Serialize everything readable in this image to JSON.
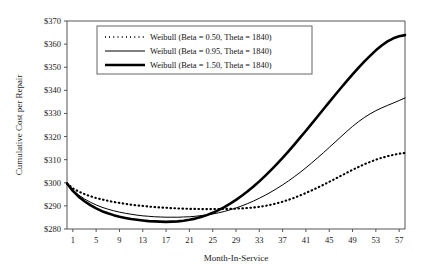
{
  "chart_data": {
    "type": "line",
    "title": "",
    "xlabel": "Month-In-Service",
    "ylabel": "Cumulative Cost per Repair",
    "xlim": [
      0,
      58
    ],
    "ylim": [
      280,
      370
    ],
    "ytick_labels": [
      "$280",
      "$290",
      "$300",
      "$310",
      "$320",
      "$330",
      "$340",
      "$350",
      "$360",
      "$370"
    ],
    "ytick_values": [
      280,
      290,
      300,
      310,
      320,
      330,
      340,
      350,
      360,
      370
    ],
    "xtick_labels": [
      "1",
      "5",
      "9",
      "13",
      "17",
      "21",
      "25",
      "29",
      "33",
      "37",
      "41",
      "45",
      "49",
      "53",
      "57"
    ],
    "xtick_values": [
      1,
      5,
      9,
      13,
      17,
      21,
      25,
      29,
      33,
      37,
      41,
      45,
      49,
      53,
      57
    ],
    "grid": false,
    "legend_position": "top-left-inside",
    "x": [
      0,
      1,
      2,
      3,
      4,
      5,
      6,
      7,
      8,
      9,
      10,
      11,
      12,
      13,
      14,
      15,
      16,
      17,
      18,
      19,
      20,
      21,
      22,
      23,
      24,
      25,
      26,
      27,
      28,
      29,
      30,
      31,
      32,
      33,
      34,
      35,
      36,
      37,
      38,
      39,
      40,
      41,
      42,
      43,
      44,
      45,
      46,
      47,
      48,
      49,
      50,
      51,
      52,
      53,
      54,
      55,
      56,
      57,
      58
    ],
    "series": [
      {
        "name": "Weibull (Beta = 0.50, Theta = 1840)",
        "beta": 0.5,
        "theta": 1840,
        "style": "dotted",
        "width": 2.0,
        "color": "#000000",
        "values": [
          299.7,
          297.6,
          296.2,
          295.1,
          294.2,
          293.4,
          292.8,
          292.2,
          291.7,
          291.3,
          290.9,
          290.5,
          290.2,
          290.0,
          289.7,
          289.5,
          289.3,
          289.2,
          289.0,
          288.9,
          288.8,
          288.7,
          288.7,
          288.6,
          288.6,
          288.6,
          288.6,
          288.7,
          288.7,
          288.8,
          288.9,
          289.1,
          289.3,
          289.6,
          290.0,
          290.5,
          291.1,
          291.8,
          292.6,
          293.5,
          294.5,
          295.6,
          296.7,
          297.9,
          299.1,
          300.4,
          301.7,
          303.0,
          304.3,
          305.6,
          306.8,
          308.0,
          309.0,
          310.0,
          310.8,
          311.5,
          312.1,
          312.6,
          312.9
        ]
      },
      {
        "name": "Weibull (Beta = 0.95, Theta = 1840)",
        "beta": 0.95,
        "theta": 1840,
        "style": "solid",
        "width": 1.0,
        "color": "#000000",
        "values": [
          299.7,
          296.9,
          294.7,
          293.0,
          291.6,
          290.4,
          289.4,
          288.6,
          287.9,
          287.3,
          286.8,
          286.4,
          286.0,
          285.7,
          285.5,
          285.3,
          285.2,
          285.1,
          285.1,
          285.1,
          285.2,
          285.3,
          285.5,
          285.8,
          286.1,
          286.5,
          287.0,
          287.6,
          288.3,
          289.1,
          290.0,
          291.0,
          292.1,
          293.3,
          294.6,
          296.0,
          297.5,
          299.1,
          300.8,
          302.6,
          304.5,
          306.5,
          308.6,
          310.8,
          313.0,
          315.3,
          317.6,
          319.9,
          322.2,
          324.4,
          326.4,
          328.2,
          329.8,
          331.2,
          332.4,
          333.5,
          334.5,
          335.6,
          336.7
        ]
      },
      {
        "name": "Weibull (Beta = 1.50, Theta = 1840)",
        "beta": 1.5,
        "theta": 1840,
        "style": "solid",
        "width": 2.6,
        "color": "#000000",
        "values": [
          299.7,
          296.5,
          294.0,
          292.0,
          290.3,
          288.9,
          287.7,
          286.8,
          286.0,
          285.3,
          284.8,
          284.3,
          284.0,
          283.7,
          283.4,
          283.3,
          283.2,
          283.1,
          283.2,
          283.3,
          283.6,
          284.0,
          284.5,
          285.2,
          286.0,
          287.0,
          288.2,
          289.5,
          291.0,
          292.6,
          294.4,
          296.3,
          298.4,
          300.6,
          303.0,
          305.5,
          308.1,
          310.8,
          313.6,
          316.5,
          319.5,
          322.5,
          325.6,
          328.7,
          331.8,
          334.9,
          338.0,
          341.0,
          344.0,
          346.9,
          349.7,
          352.4,
          354.9,
          357.3,
          359.4,
          361.2,
          362.5,
          363.4,
          363.9
        ]
      }
    ]
  },
  "legend": {
    "entries": [
      {
        "label": "Weibull (Beta = 0.50, Theta = 1840)",
        "sample": "dotted"
      },
      {
        "label": "Weibull (Beta = 0.95, Theta = 1840)",
        "sample": "thin-solid"
      },
      {
        "label": "Weibull (Beta = 1.50, Theta = 1840)",
        "sample": "thick-solid"
      }
    ]
  },
  "colors": {
    "axis": "#555555",
    "line": "#000000",
    "text": "#1a1a1a",
    "legend_border": "#666666",
    "background": "#ffffff"
  }
}
